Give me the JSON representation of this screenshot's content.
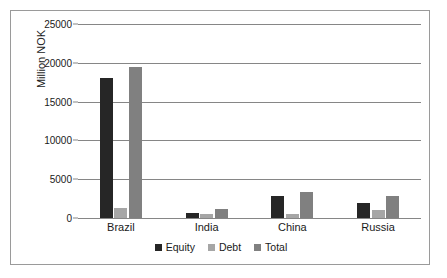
{
  "chart_data": {
    "type": "bar",
    "title": "",
    "subtitle": "",
    "xlabel": "",
    "ylabel": "Million NOK",
    "ylim": [
      0,
      25000
    ],
    "yticks": [
      0,
      5000,
      10000,
      15000,
      20000,
      25000
    ],
    "ytick_labels": [
      "0",
      "5000",
      "10000",
      "15000",
      "20000",
      "25000"
    ],
    "grid": true,
    "legend_position": "bottom",
    "categories": [
      "Brazil",
      "India",
      "China",
      "Russia"
    ],
    "series": [
      {
        "name": "Equity",
        "color": "#262626",
        "values": [
          18000,
          620,
          2900,
          1900
        ]
      },
      {
        "name": "Debt",
        "color": "#a6a6a6",
        "values": [
          1300,
          520,
          520,
          1050
        ]
      },
      {
        "name": "Total",
        "color": "#808080",
        "values": [
          19400,
          1150,
          3400,
          2900
        ]
      }
    ]
  },
  "legend": {
    "items": [
      {
        "label": "Equity",
        "color": "#262626"
      },
      {
        "label": "Debt",
        "color": "#a6a6a6"
      },
      {
        "label": "Total",
        "color": "#808080"
      }
    ]
  }
}
